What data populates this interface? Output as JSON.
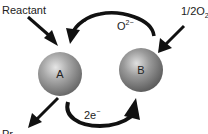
{
  "diagram": {
    "type": "redox-catalytic-cycle",
    "nodes": [
      {
        "id": "A",
        "label": "A",
        "color": "#9a9a9a"
      },
      {
        "id": "B",
        "label": "B",
        "color": "#8c8c8c"
      }
    ],
    "labels": {
      "reactant": "Reactant",
      "oxygen_half": "1/2O",
      "oxygen_sub": "2",
      "oxide_ion": "O",
      "oxide_charge": "2−",
      "electrons": "2e",
      "electrons_charge": "−",
      "product_partial": "Pr"
    },
    "edges": [
      {
        "from": "Reactant",
        "to": "A",
        "style": "straight-arrow"
      },
      {
        "from": "1/2O2",
        "to": "B",
        "style": "straight-arrow"
      },
      {
        "from": "B",
        "to": "A",
        "label": "O2−",
        "style": "curved-arrow-top"
      },
      {
        "from": "A",
        "to": "B",
        "label": "2e−",
        "style": "curved-arrow-bottom"
      },
      {
        "from": "A",
        "to": "Product",
        "style": "straight-arrow"
      }
    ]
  }
}
